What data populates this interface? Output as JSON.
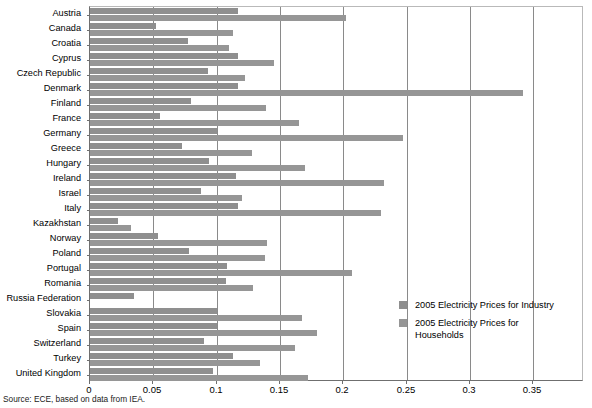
{
  "chart_data": {
    "type": "bar",
    "orientation": "horizontal",
    "title": "",
    "xlabel": "",
    "ylabel": "",
    "xlim": [
      0,
      0.39
    ],
    "xticks": [
      "0",
      "0.05",
      "0.1",
      "0.15",
      "0.2",
      "0.25",
      "0.3",
      "0.35"
    ],
    "xtick_values": [
      0,
      0.05,
      0.1,
      0.15,
      0.2,
      0.25,
      0.3,
      0.35
    ],
    "grid": "vertical",
    "legend_position": "inside-right-lower",
    "categories": [
      "Austria",
      "Canada",
      "Croatia",
      "Cyprus",
      "Czech Republic",
      "Denmark",
      "Finland",
      "France",
      "Germany",
      "Greece",
      "Hungary",
      "Ireland",
      "Israel",
      "Italy",
      "Kazakhstan",
      "Norway",
      "Poland",
      "Portugal",
      "Romania",
      "Russia Federation",
      "Slovakia",
      "Spain",
      "Switzerland",
      "Turkey",
      "United Kingdom"
    ],
    "series": [
      {
        "name": "2005 Electricity Prices for Industry",
        "color": "#8f8f8f",
        "values": [
          0.117,
          0.052,
          0.077,
          0.117,
          0.093,
          0.117,
          0.08,
          0.055,
          0.1,
          0.073,
          0.094,
          0.115,
          0.088,
          0.117,
          0.022,
          0.054,
          0.078,
          0.108,
          0.107,
          0.035,
          0.1,
          0.1,
          0.09,
          0.113,
          0.097
        ]
      },
      {
        "name": "2005 Electricity Prices for Households",
        "color": "#969696",
        "values": [
          0.202,
          0.113,
          0.11,
          0.145,
          0.122,
          0.342,
          0.139,
          0.165,
          0.247,
          0.128,
          0.17,
          0.232,
          0.12,
          0.23,
          0.032,
          0.14,
          0.138,
          0.207,
          0.129,
          0.0,
          0.167,
          0.179,
          0.162,
          0.134,
          0.172
        ]
      }
    ]
  },
  "legend": {
    "entries": [
      {
        "label": "2005 Electricity Prices for Industry"
      },
      {
        "label": "2005 Electricity Prices for Households"
      }
    ]
  },
  "source_note": "Source: ECE, based on data from IEA."
}
